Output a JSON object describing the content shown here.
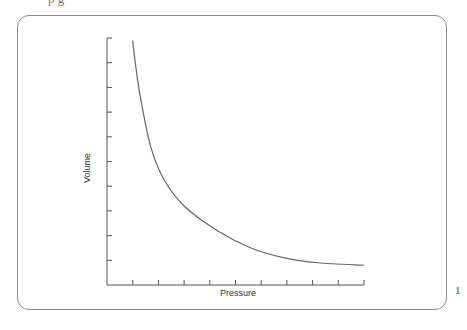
{
  "page": {
    "top_cut_text": "p            g",
    "right_cut_text": "1"
  },
  "chart_data": {
    "type": "line",
    "title": "",
    "xlabel": "Pressure",
    "ylabel": "Volume",
    "xlim": [
      0,
      10
    ],
    "ylim": [
      0,
      10
    ],
    "x_ticks": 10,
    "y_ticks": 10,
    "tick_labels_shown": false,
    "grid": false,
    "legend": "none",
    "series": [
      {
        "name": "Volume vs Pressure",
        "color": "#666666",
        "x": [
          1.0,
          1.1,
          1.3,
          1.7,
          2.2,
          3.0,
          4.3,
          5.6,
          6.9,
          8.2,
          10.0
        ],
        "y": [
          9.9,
          9.0,
          7.6,
          5.6,
          4.3,
          3.2,
          2.2,
          1.5,
          1.1,
          0.9,
          0.8
        ]
      }
    ]
  }
}
